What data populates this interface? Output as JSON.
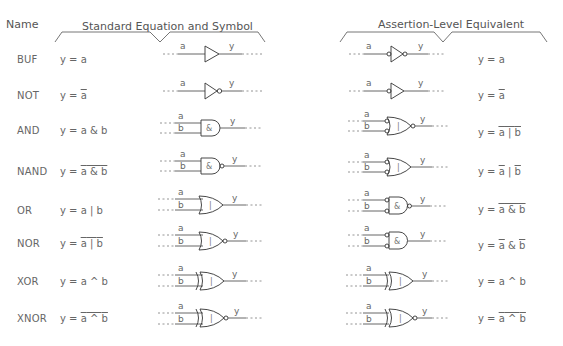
{
  "headers": {
    "name": "Name",
    "standard": "Standard Equation and Symbol",
    "assertion": "Assertion-Level Equivalent"
  },
  "rows": [
    {
      "name": "BUF",
      "std_eq": "y = a",
      "assert_eq": "y = a",
      "std_gate": "buffer",
      "assert_gate": "buffer with inverted input and output",
      "std_symbol": "",
      "assert_symbol": ""
    },
    {
      "name": "NOT",
      "std_eq": "y = ā",
      "assert_eq": "y = ā",
      "std_gate": "inverter (output bubble)",
      "assert_gate": "buffer with input bubble",
      "std_symbol": "",
      "assert_symbol": ""
    },
    {
      "name": "AND",
      "std_eq": "y = a & b",
      "assert_eq": "y = ¬(ā | b̄)",
      "std_gate": "and",
      "assert_gate": "or with inverted inputs and output",
      "std_symbol": "&",
      "assert_symbol": "|"
    },
    {
      "name": "NAND",
      "std_eq": "y = ¬(a & b)",
      "assert_eq": "y = ā | b̄",
      "std_gate": "nand",
      "assert_gate": "or with inverted inputs",
      "std_symbol": "&",
      "assert_symbol": "|"
    },
    {
      "name": "OR",
      "std_eq": "y = a | b",
      "assert_eq": "y = ¬(ā & b̄)",
      "std_gate": "or",
      "assert_gate": "and with inverted inputs and output",
      "std_symbol": "|",
      "assert_symbol": "&"
    },
    {
      "name": "NOR",
      "std_eq": "y = ¬(a | b)",
      "assert_eq": "y = ā & b̄",
      "std_gate": "nor",
      "assert_gate": "and with inverted inputs",
      "std_symbol": "|",
      "assert_symbol": "&"
    },
    {
      "name": "XOR",
      "std_eq": "y = a ^ b",
      "assert_eq": "y = a ^ b",
      "std_gate": "xor",
      "assert_gate": "xor",
      "std_symbol": "|",
      "assert_symbol": "|"
    },
    {
      "name": "XNOR",
      "std_eq": "y = ¬(a ^ b)",
      "assert_eq": "y = ¬(a ^ b)",
      "std_gate": "xnor",
      "assert_gate": "xnor",
      "std_symbol": "|",
      "assert_symbol": "|"
    }
  ],
  "eq_parts": {
    "prefix": "y = ",
    "a": "a",
    "b": "b",
    "amp": " & ",
    "bar": " | ",
    "xor": " ^ "
  },
  "pin_labels": {
    "a": "a",
    "b": "b",
    "y": "y"
  },
  "colors": {
    "line": "#666666",
    "gate": "#444444",
    "text": "#666666"
  }
}
